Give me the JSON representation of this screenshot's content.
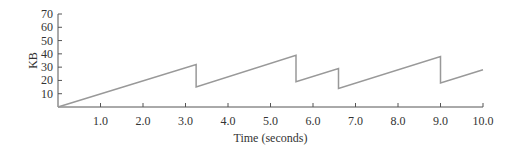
{
  "chart_data": {
    "type": "line",
    "title": "",
    "xlabel": "Time (seconds)",
    "ylabel": "KB",
    "xlim": [
      0,
      10
    ],
    "ylim": [
      0,
      70
    ],
    "x_ticks": [
      "1.0",
      "2.0",
      "3.0",
      "4.0",
      "5.0",
      "6.0",
      "7.0",
      "8.0",
      "9.0",
      "10.0"
    ],
    "y_ticks": [
      "10",
      "20",
      "30",
      "40",
      "50",
      "60",
      "70"
    ],
    "grid": false,
    "legend": null,
    "series": [
      {
        "name": "KB",
        "color": "#999999",
        "x": [
          0,
          3.25,
          3.25,
          5.6,
          5.6,
          6.6,
          6.6,
          9.0,
          9.0,
          10.0
        ],
        "y": [
          0,
          32,
          15,
          39,
          19,
          29,
          14,
          38,
          18,
          28
        ]
      }
    ]
  }
}
